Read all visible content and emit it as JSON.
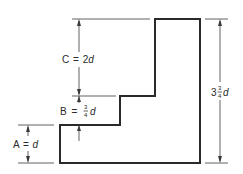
{
  "diagram": {
    "type": "stepped-profile-dimension-drawing",
    "shape": {
      "description": "Stepped L-shaped profile with two steps on the left side",
      "outline_color": "#2a2a2a"
    },
    "dimensions": {
      "A": {
        "letter": "A",
        "eq": "=",
        "value": "d",
        "label": "A = d"
      },
      "B": {
        "letter": "B",
        "eq": "=",
        "numerator": "3",
        "denominator": "4",
        "unit": "d",
        "label": "B = 3/4 d"
      },
      "C": {
        "letter": "C",
        "eq": "=",
        "coefficient": "2",
        "unit": "d",
        "label": "C = 2d"
      },
      "total": {
        "whole": "3",
        "numerator": "3",
        "denominator": "4",
        "unit": "d",
        "label": "3 3/4 d"
      }
    }
  }
}
